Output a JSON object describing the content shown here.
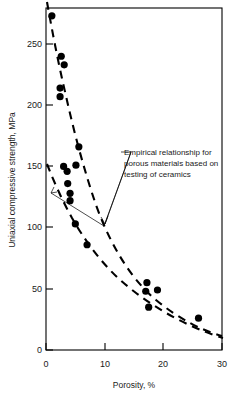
{
  "chart_data": {
    "type": "scatter",
    "title": "",
    "xlabel": "Porosity, %",
    "ylabel": "Uniaxial compressive strength, MPa",
    "xlim": [
      0,
      30
    ],
    "ylim": [
      0,
      300
    ],
    "xticks": [
      0,
      10,
      20,
      30
    ],
    "yticks": [
      0,
      50,
      100,
      150,
      200,
      250
    ],
    "xtick_labels": [
      "0",
      "10",
      "20",
      "30"
    ],
    "ytick_labels": [
      "0",
      "50",
      "100",
      "150",
      "200",
      "250"
    ],
    "grid": false,
    "legend": null,
    "series": [
      {
        "name": "Rock specimens",
        "marker": "filled-circle",
        "color": "#000000",
        "points": [
          {
            "x": 1.0,
            "y": 273
          },
          {
            "x": 2.6,
            "y": 240
          },
          {
            "x": 3.1,
            "y": 233
          },
          {
            "x": 2.4,
            "y": 214
          },
          {
            "x": 2.4,
            "y": 207
          },
          {
            "x": 5.6,
            "y": 166
          },
          {
            "x": 3.0,
            "y": 150
          },
          {
            "x": 5.1,
            "y": 151
          },
          {
            "x": 3.6,
            "y": 146
          },
          {
            "x": 3.7,
            "y": 136
          },
          {
            "x": 4.1,
            "y": 128
          },
          {
            "x": 4.1,
            "y": 122
          },
          {
            "x": 5.0,
            "y": 103
          },
          {
            "x": 7.0,
            "y": 86
          },
          {
            "x": 17.2,
            "y": 55
          },
          {
            "x": 19.0,
            "y": 49
          },
          {
            "x": 17.0,
            "y": 48
          },
          {
            "x": 17.5,
            "y": 35
          },
          {
            "x": 26.0,
            "y": 26
          }
        ]
      }
    ],
    "curves": [
      {
        "name": "upper-bound-empirical-curve",
        "style": "dashed",
        "color": "#000000",
        "points": [
          {
            "x": 0.4,
            "y": 300
          },
          {
            "x": 1.2,
            "y": 262
          },
          {
            "x": 2.5,
            "y": 228
          },
          {
            "x": 4.0,
            "y": 196
          },
          {
            "x": 5.5,
            "y": 168
          },
          {
            "x": 7.5,
            "y": 142
          },
          {
            "x": 10.0,
            "y": 116
          },
          {
            "x": 13.0,
            "y": 93
          },
          {
            "x": 16.5,
            "y": 74
          },
          {
            "x": 20.0,
            "y": 60
          },
          {
            "x": 24.0,
            "y": 48
          },
          {
            "x": 28.0,
            "y": 40
          },
          {
            "x": 30.0,
            "y": 37
          }
        ]
      },
      {
        "name": "lower-bound-empirical-curve",
        "style": "dashed",
        "color": "#000000",
        "points": [
          {
            "x": 0.2,
            "y": 152
          },
          {
            "x": 1.5,
            "y": 136
          },
          {
            "x": 3.0,
            "y": 120
          },
          {
            "x": 5.0,
            "y": 102
          },
          {
            "x": 7.0,
            "y": 87
          },
          {
            "x": 10.0,
            "y": 70
          },
          {
            "x": 13.0,
            "y": 57
          },
          {
            "x": 16.0,
            "y": 47
          },
          {
            "x": 19.5,
            "y": 39
          },
          {
            "x": 23.0,
            "y": 32
          },
          {
            "x": 26.5,
            "y": 27
          },
          {
            "x": 30.0,
            "y": 23
          }
        ]
      }
    ],
    "annotations": [
      {
        "name": "empirical-relationship-note",
        "lines": [
          "Empirical relationship for",
          "porous materials based on",
          "testing of ceramics"
        ],
        "leader_targets": [
          {
            "x": 4.6,
            "y": 101
          },
          {
            "x": 0.6,
            "y": 128
          }
        ]
      }
    ]
  }
}
